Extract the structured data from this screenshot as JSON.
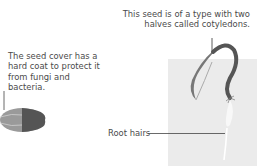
{
  "labels": {
    "seed_cover": "The seed cover has a hard coat to protect it from fungi and bacteria.",
    "cotyledons": "This seed is of a type with two halves called cotyledons.",
    "root_hairs": "Root hairs"
  },
  "colors": {
    "soil_panel": "#ebebeb",
    "seed_dark": "#555555",
    "seed_light": "#9a9a9a",
    "leader_line": "#333333"
  }
}
